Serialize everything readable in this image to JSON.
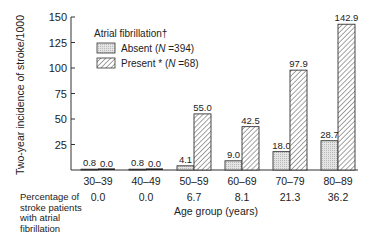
{
  "chart_data": {
    "type": "bar",
    "title": "",
    "xlabel": "Age group (years)",
    "ylabel": "Two-year incidence of stroke/1000",
    "ylim": [
      0,
      150
    ],
    "yticks": [
      25,
      50,
      75,
      100,
      125,
      150
    ],
    "categories": [
      "30–39",
      "40–49",
      "50–59",
      "60–69",
      "70–79",
      "80–89"
    ],
    "series": [
      {
        "name": "Absent (N = 394)",
        "pattern": "dotted",
        "values": [
          0.8,
          0.8,
          4.1,
          9.0,
          18.0,
          28.7
        ],
        "labels": [
          "0.8",
          "0.8",
          "4.1",
          "9.0",
          "18.0",
          "28.7"
        ]
      },
      {
        "name": "Present* (N = 68)",
        "pattern": "hatched",
        "values": [
          0.0,
          0.0,
          55.0,
          42.5,
          97.9,
          142.9
        ],
        "labels": [
          "0.0",
          "0.0",
          "55.0",
          "42.5",
          "97.9",
          "142.9"
        ]
      }
    ],
    "legend": {
      "title": "Atrial fibrillation†",
      "position": "upper-left",
      "entries": [
        {
          "label": "Absent (",
          "italic": "N",
          "rest": " =394)"
        },
        {
          "label": "Present * (",
          "italic": "N",
          "rest": " =68)"
        }
      ]
    },
    "row_table": {
      "label_lines": [
        "Percentage of",
        "stroke patients",
        "with atrial",
        "fibrillation"
      ],
      "values": [
        "0.0",
        "0.0",
        "6.7",
        "8.1",
        "21.3",
        "36.2"
      ]
    },
    "grid": false
  }
}
